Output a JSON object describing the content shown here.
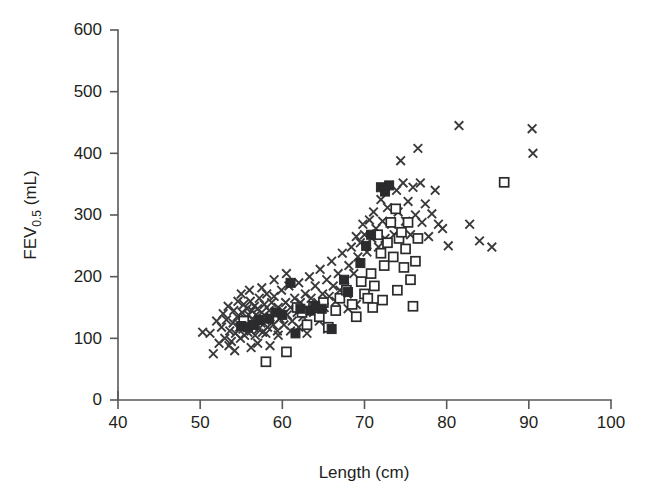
{
  "chart_data": {
    "type": "scatter",
    "title": "",
    "xlabel": "Length (cm)",
    "ylabel": "FEV0.5 (mL)",
    "ylabel_base": "FEV",
    "ylabel_sub": "0.5",
    "ylabel_unit": " (mL)",
    "xlim": [
      40,
      100
    ],
    "ylim": [
      0,
      600
    ],
    "xticks": [
      40,
      50,
      60,
      70,
      80,
      90,
      100
    ],
    "yticks": [
      0,
      100,
      200,
      300,
      400,
      500,
      600
    ],
    "grid": false,
    "legend": "none",
    "series": [
      {
        "name": "cross",
        "marker": "x",
        "color": "#3a3a3c",
        "points": [
          [
            50.3,
            110
          ],
          [
            51.2,
            108
          ],
          [
            51.6,
            75
          ],
          [
            52.0,
            128
          ],
          [
            52.3,
            92
          ],
          [
            52.6,
            118
          ],
          [
            52.8,
            140
          ],
          [
            53.0,
            100
          ],
          [
            53.2,
            130
          ],
          [
            53.4,
            152
          ],
          [
            53.6,
            112
          ],
          [
            53.8,
            95
          ],
          [
            54.0,
            125
          ],
          [
            54.1,
            145
          ],
          [
            54.3,
            108
          ],
          [
            54.5,
            135
          ],
          [
            54.6,
            160
          ],
          [
            54.8,
            118
          ],
          [
            54.9,
            100
          ],
          [
            55.0,
            128
          ],
          [
            55.1,
            142
          ],
          [
            55.2,
            115
          ],
          [
            55.3,
            155
          ],
          [
            55.4,
            105
          ],
          [
            55.5,
            132
          ],
          [
            55.6,
            120
          ],
          [
            55.7,
            148
          ],
          [
            55.8,
            110
          ],
          [
            55.9,
            138
          ],
          [
            56.0,
            125
          ],
          [
            56.1,
            160
          ],
          [
            56.2,
            112
          ],
          [
            56.3,
            145
          ],
          [
            56.4,
            130
          ],
          [
            56.5,
            118
          ],
          [
            56.6,
            152
          ],
          [
            56.7,
            105
          ],
          [
            56.8,
            138
          ],
          [
            56.9,
            122
          ],
          [
            57.0,
            148
          ],
          [
            57.1,
            115
          ],
          [
            57.2,
            165
          ],
          [
            57.3,
            132
          ],
          [
            57.4,
            125
          ],
          [
            57.5,
            142
          ],
          [
            57.6,
            110
          ],
          [
            57.8,
            155
          ],
          [
            58.0,
            128
          ],
          [
            58.1,
            172
          ],
          [
            58.2,
            118
          ],
          [
            58.4,
            145
          ],
          [
            58.5,
            135
          ],
          [
            58.7,
            158
          ],
          [
            58.9,
            122
          ],
          [
            59.0,
            168
          ],
          [
            59.2,
            140
          ],
          [
            59.4,
            112
          ],
          [
            59.5,
            150
          ],
          [
            59.7,
            132
          ],
          [
            59.9,
            178
          ],
          [
            60.0,
            145
          ],
          [
            60.2,
            122
          ],
          [
            60.4,
            158
          ],
          [
            60.6,
            138
          ],
          [
            60.8,
            185
          ],
          [
            61.0,
            150
          ],
          [
            61.2,
            128
          ],
          [
            61.5,
            165
          ],
          [
            61.8,
            142
          ],
          [
            62.0,
            190
          ],
          [
            62.2,
            158
          ],
          [
            62.5,
            135
          ],
          [
            62.8,
            172
          ],
          [
            63.0,
            148
          ],
          [
            63.3,
            200
          ],
          [
            63.5,
            165
          ],
          [
            63.8,
            142
          ],
          [
            64.0,
            185
          ],
          [
            64.3,
            158
          ],
          [
            64.6,
            212
          ],
          [
            64.9,
            172
          ],
          [
            65.1,
            150
          ],
          [
            65.4,
            195
          ],
          [
            65.7,
            168
          ],
          [
            66.0,
            225
          ],
          [
            66.2,
            185
          ],
          [
            66.5,
            160
          ],
          [
            66.8,
            205
          ],
          [
            67.0,
            178
          ],
          [
            67.3,
            238
          ],
          [
            67.6,
            195
          ],
          [
            67.9,
            172
          ],
          [
            68.1,
            218
          ],
          [
            68.4,
            248
          ],
          [
            68.7,
            205
          ],
          [
            69.0,
            265
          ],
          [
            69.2,
            232
          ],
          [
            69.5,
            255
          ],
          [
            69.8,
            285
          ],
          [
            70.0,
            268
          ],
          [
            70.3,
            240
          ],
          [
            70.6,
            292
          ],
          [
            70.9,
            262
          ],
          [
            71.1,
            305
          ],
          [
            71.4,
            278
          ],
          [
            71.7,
            248
          ],
          [
            72.0,
            325
          ],
          [
            72.2,
            290
          ],
          [
            72.5,
            262
          ],
          [
            72.8,
            312
          ],
          [
            73.0,
            348
          ],
          [
            73.3,
            285
          ],
          [
            73.6,
            268
          ],
          [
            73.9,
            340
          ],
          [
            74.1,
            305
          ],
          [
            74.4,
            388
          ],
          [
            74.7,
            352
          ],
          [
            75.0,
            290
          ],
          [
            75.3,
            322
          ],
          [
            75.6,
            268
          ],
          [
            75.9,
            345
          ],
          [
            76.2,
            300
          ],
          [
            76.5,
            408
          ],
          [
            76.8,
            352
          ],
          [
            77.0,
            288
          ],
          [
            77.4,
            318
          ],
          [
            77.8,
            265
          ],
          [
            78.2,
            302
          ],
          [
            78.6,
            340
          ],
          [
            79.0,
            285
          ],
          [
            79.5,
            278
          ],
          [
            80.2,
            250
          ],
          [
            81.5,
            445
          ],
          [
            82.8,
            285
          ],
          [
            84.0,
            258
          ],
          [
            85.5,
            248
          ],
          [
            90.4,
            440
          ],
          [
            90.5,
            400
          ],
          [
            53.5,
            88
          ],
          [
            54.2,
            80
          ],
          [
            56.2,
            85
          ],
          [
            57.0,
            92
          ],
          [
            58.5,
            88
          ],
          [
            55.0,
            172
          ],
          [
            56.0,
            178
          ],
          [
            57.5,
            182
          ],
          [
            59.0,
            195
          ],
          [
            60.5,
            205
          ],
          [
            62.0,
            118
          ],
          [
            63.0,
            108
          ],
          [
            64.5,
            128
          ],
          [
            65.5,
            115
          ],
          [
            58.0,
            108
          ],
          [
            59.5,
            105
          ],
          [
            61.0,
            112
          ],
          [
            68.0,
            148
          ],
          [
            69.0,
            155
          ]
        ]
      },
      {
        "name": "open-square",
        "marker": "square-open",
        "color": "#2b2b2d",
        "points": [
          [
            55.3,
            128
          ],
          [
            58.0,
            62
          ],
          [
            60.5,
            78
          ],
          [
            61.8,
            150
          ],
          [
            62.4,
            142
          ],
          [
            63.0,
            122
          ],
          [
            63.8,
            152
          ],
          [
            64.5,
            135
          ],
          [
            65.0,
            158
          ],
          [
            65.6,
            118
          ],
          [
            66.5,
            145
          ],
          [
            67.0,
            165
          ],
          [
            67.8,
            178
          ],
          [
            68.5,
            155
          ],
          [
            69.0,
            135
          ],
          [
            69.6,
            192
          ],
          [
            70.0,
            172
          ],
          [
            70.4,
            165
          ],
          [
            70.8,
            205
          ],
          [
            71.2,
            185
          ],
          [
            71.6,
            268
          ],
          [
            72.0,
            238
          ],
          [
            72.4,
            218
          ],
          [
            72.8,
            255
          ],
          [
            73.2,
            288
          ],
          [
            73.5,
            232
          ],
          [
            73.8,
            310
          ],
          [
            74.2,
            262
          ],
          [
            74.5,
            272
          ],
          [
            74.8,
            215
          ],
          [
            75.0,
            245
          ],
          [
            75.3,
            288
          ],
          [
            75.6,
            195
          ],
          [
            75.9,
            152
          ],
          [
            76.2,
            225
          ],
          [
            76.5,
            262
          ],
          [
            71.0,
            150
          ],
          [
            72.2,
            162
          ],
          [
            74.0,
            178
          ],
          [
            87.0,
            353
          ]
        ]
      },
      {
        "name": "filled-square",
        "marker": "square-filled",
        "color": "#2b2b2d",
        "points": [
          [
            55.0,
            120
          ],
          [
            55.8,
            118
          ],
          [
            56.5,
            122
          ],
          [
            57.2,
            130
          ],
          [
            58.4,
            132
          ],
          [
            59.2,
            142
          ],
          [
            60.0,
            138
          ],
          [
            61.0,
            190
          ],
          [
            61.6,
            108
          ],
          [
            62.2,
            148
          ],
          [
            63.4,
            145
          ],
          [
            64.0,
            152
          ],
          [
            64.8,
            148
          ],
          [
            66.0,
            115
          ],
          [
            68.0,
            175
          ],
          [
            70.2,
            250
          ],
          [
            70.8,
            268
          ],
          [
            72.0,
            345
          ],
          [
            72.5,
            338
          ],
          [
            73.0,
            348
          ],
          [
            69.5,
            222
          ],
          [
            67.5,
            195
          ]
        ]
      }
    ]
  },
  "axes": {
    "x_title": "Length (cm)",
    "y_title_base": "FEV",
    "y_title_sub": "0.5",
    "y_title_unit": "(mL)"
  }
}
